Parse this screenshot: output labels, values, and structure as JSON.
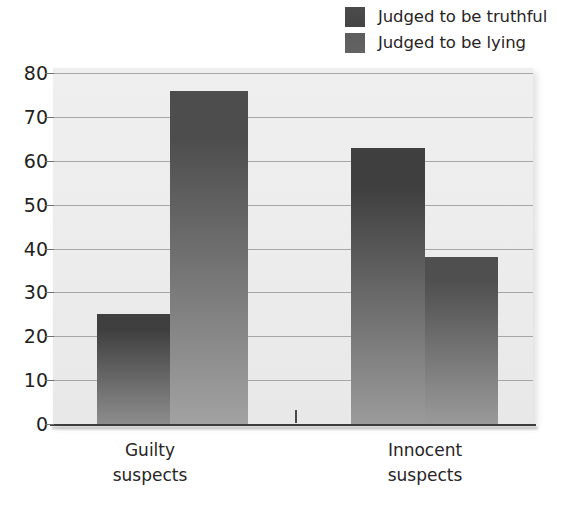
{
  "chart_data": {
    "type": "bar",
    "title": "",
    "xlabel": "",
    "ylabel": "",
    "ylim": [
      0,
      80
    ],
    "yticks": [
      0,
      10,
      20,
      30,
      40,
      50,
      60,
      70,
      80
    ],
    "ytick_labels": [
      "0",
      "10",
      "20",
      "30",
      "40",
      "50",
      "60",
      "70",
      "80"
    ],
    "grid": true,
    "legend_position": "top-right",
    "categories": [
      "Guilty suspects",
      "Innocent suspects"
    ],
    "category_lines": [
      [
        "Guilty",
        "suspects"
      ],
      [
        "Innocent",
        "suspects"
      ]
    ],
    "series": [
      {
        "name": "Judged to be truthful",
        "color": "#4b4b4b",
        "values": [
          25,
          63
        ]
      },
      {
        "name": "Judged to be lying",
        "color": "#5d5d5d",
        "values": [
          76,
          38
        ]
      }
    ]
  },
  "legend": {
    "items": [
      {
        "label": "Judged to be truthful",
        "swatch_color": "#4b4b4b",
        "swatch_name": "legend-swatch-truthful"
      },
      {
        "label": "Judged to be lying",
        "swatch_color": "#5d5d5d",
        "swatch_name": "legend-swatch-lying"
      }
    ]
  },
  "axes": {
    "y": {
      "labels": [
        "80",
        "70",
        "60",
        "50",
        "40",
        "30",
        "20",
        "10",
        "0"
      ]
    },
    "x": {
      "labels": [
        {
          "line1": "Guilty",
          "line2": "suspects"
        },
        {
          "line1": "Innocent",
          "line2": "suspects"
        }
      ]
    }
  },
  "bars": [
    {
      "name": "bar-guilty-truthful",
      "group": "Guilty suspects",
      "series": "Judged to be truthful",
      "value": 25,
      "top_color": "#3f3f3f",
      "bottom_color": "#8d8d8d"
    },
    {
      "name": "bar-guilty-lying",
      "group": "Guilty suspects",
      "series": "Judged to be lying",
      "value": 76,
      "top_color": "#4d4d4d",
      "bottom_color": "#a2a2a2"
    },
    {
      "name": "bar-innocent-truthful",
      "group": "Innocent suspects",
      "series": "Judged to be truthful",
      "value": 63,
      "top_color": "#3f3f3f",
      "bottom_color": "#9b9b9b"
    },
    {
      "name": "bar-innocent-lying",
      "group": "Innocent suspects",
      "series": "Judged to be lying",
      "value": 38,
      "top_color": "#4f4f4f",
      "bottom_color": "#9a9a9a"
    }
  ],
  "colors": {
    "plot_background": "#ececec",
    "gridline": "#9a9a9a",
    "axis": "#3d3d3d",
    "text": "#231f20"
  }
}
